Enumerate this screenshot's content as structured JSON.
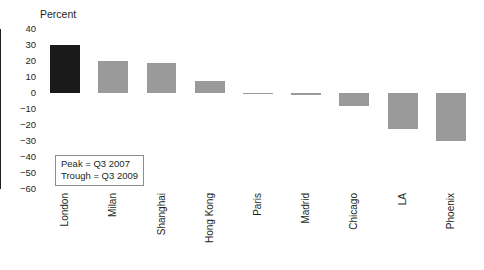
{
  "chart_data": {
    "type": "bar",
    "title": "",
    "subtitle": "",
    "xlabel": "",
    "ylabel": "Percent",
    "ylim": [
      -60,
      40
    ],
    "ytick_step": 10,
    "yticks": [
      40,
      30,
      20,
      10,
      0,
      "−10",
      "−20",
      "−30",
      "−40",
      "−50",
      "−60"
    ],
    "grid": false,
    "legend": "none",
    "categories": [
      "London",
      "Milan",
      "Shanghai",
      "Hong Kong",
      "Paris",
      "Madrid",
      "Chicago",
      "LA",
      "Phoenix"
    ],
    "values": [
      30,
      20,
      19,
      7.5,
      0.3,
      -1,
      -8,
      -22.5,
      -30
    ],
    "bar_colors": [
      "#1a1a1a",
      "#9a9a9a",
      "#9a9a9a",
      "#9a9a9a",
      "#9a9a9a",
      "#9a9a9a",
      "#9a9a9a",
      "#9a9a9a",
      "#9a9a9a"
    ],
    "annotations": [
      "Peak = Q3 2007",
      "Trough = Q3 2009"
    ]
  },
  "colors": {
    "highlight_bar": "#1a1a1a",
    "default_bar": "#9a9a9a",
    "axis": "#231f20",
    "annotation_border": "#8d8d8d",
    "background": "#ffffff"
  },
  "annotation": {
    "peak": "Peak = Q3 2007",
    "trough": "Trough = Q3 2009"
  }
}
